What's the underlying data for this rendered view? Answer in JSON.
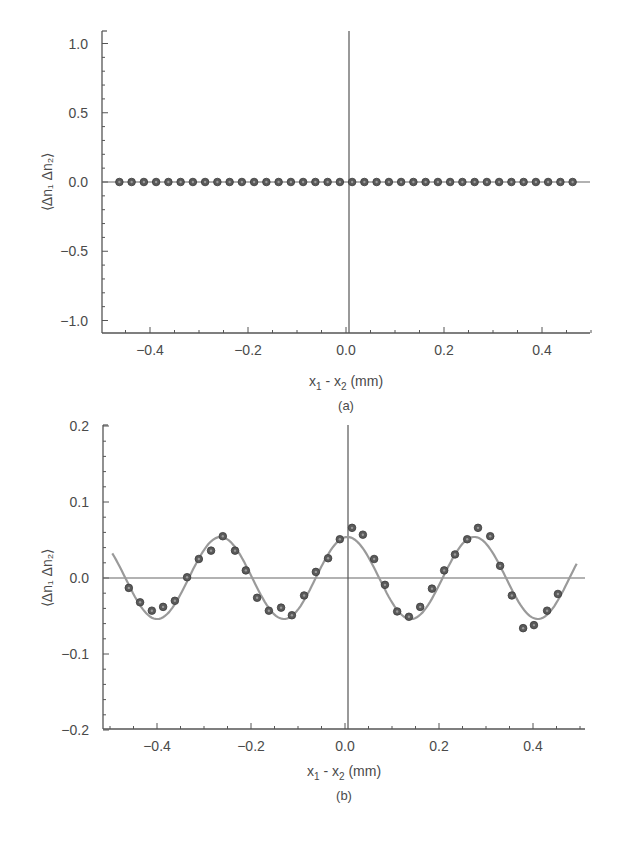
{
  "figure": {
    "panels": [
      {
        "id": "a",
        "caption": "(a)",
        "ylabel": "⟨Δn₁ Δn₂⟩",
        "xlabel_main": "x",
        "xlabel_sub1": "1",
        "xlabel_mid": " - x",
        "xlabel_sub2": "2",
        "xlabel_unit": " (mm)"
      },
      {
        "id": "b",
        "caption": "(b)",
        "ylabel": "⟨Δn₁ Δn₂⟩",
        "xlabel_main": "x",
        "xlabel_sub1": "1",
        "xlabel_mid": " - x",
        "xlabel_sub2": "2",
        "xlabel_unit": " (mm)"
      }
    ]
  },
  "colors": {
    "axis": "#555555",
    "marker_fill": "#5a5a5a",
    "marker_edge": "#3a3a3a",
    "fit_curve": "#9a9a9a",
    "text": "#4a4a4a"
  },
  "chart_data": [
    {
      "type": "scatter",
      "panel": "(a)",
      "title": "",
      "xlabel": "x1 - x2 (mm)",
      "ylabel": "<Δn1 Δn2>",
      "xlim": [
        -0.5,
        0.5
      ],
      "ylim": [
        -1.1,
        1.1
      ],
      "xticks": [
        -0.4,
        -0.2,
        0.0,
        0.2,
        0.4
      ],
      "xtick_labels": [
        "−0.4",
        "−0.2",
        "0.0",
        "0.2",
        "0.4"
      ],
      "yticks": [
        -1.0,
        -0.5,
        0.0,
        0.5,
        1.0
      ],
      "ytick_labels": [
        "−1.0",
        "−0.5",
        "0.0",
        "0.5",
        "1.0"
      ],
      "reference_lines": {
        "horizontal_y": 0.0,
        "vertical_x": 0.0
      },
      "grid": false,
      "series": [
        {
          "name": "measured",
          "style": "markers",
          "x": [
            -0.4625,
            -0.4375,
            -0.4125,
            -0.3875,
            -0.3625,
            -0.3375,
            -0.3125,
            -0.2875,
            -0.2625,
            -0.2375,
            -0.2125,
            -0.1875,
            -0.1625,
            -0.1375,
            -0.1125,
            -0.0875,
            -0.0625,
            -0.0375,
            -0.0125,
            0.0125,
            0.0375,
            0.0625,
            0.0875,
            0.1125,
            0.1375,
            0.1625,
            0.1875,
            0.2125,
            0.2375,
            0.2625,
            0.2875,
            0.3125,
            0.3375,
            0.3625,
            0.3875,
            0.4125,
            0.4375,
            0.4625
          ],
          "y": [
            0.0,
            0.0,
            0.0,
            0.0,
            0.0,
            0.0,
            0.0,
            0.0,
            0.0,
            0.0,
            0.0,
            0.0,
            0.0,
            0.0,
            0.0,
            0.0,
            0.0,
            0.0,
            0.0,
            0.0,
            0.0,
            0.0,
            0.0,
            0.0,
            0.0,
            0.0,
            0.0,
            0.0,
            0.0,
            0.0,
            0.0,
            0.0,
            0.0,
            0.0,
            0.0,
            0.0,
            0.0,
            0.0
          ]
        }
      ]
    },
    {
      "type": "scatter",
      "panel": "(b)",
      "title": "",
      "xlabel": "x1 - x2 (mm)",
      "ylabel": "<Δn1 Δn2>",
      "xlim": [
        -0.52,
        0.51
      ],
      "ylim": [
        -0.2,
        0.2
      ],
      "xticks": [
        -0.4,
        -0.2,
        0.0,
        0.2,
        0.4
      ],
      "xtick_labels": [
        "−0.4",
        "−0.2",
        "0.0",
        "0.2",
        "0.4"
      ],
      "yticks": [
        -0.2,
        -0.1,
        0.0,
        0.1,
        0.2
      ],
      "ytick_labels": [
        "−0.2",
        "−0.1",
        "0.0",
        "0.1",
        "0.2"
      ],
      "reference_lines": {
        "horizontal_y": 0.0,
        "vertical_x": 0.0
      },
      "grid": false,
      "series": [
        {
          "name": "measured",
          "style": "markers",
          "x": [
            -0.46,
            -0.436,
            -0.411,
            -0.387,
            -0.362,
            -0.336,
            -0.311,
            -0.285,
            -0.26,
            -0.234,
            -0.211,
            -0.187,
            -0.162,
            -0.136,
            -0.113,
            -0.087,
            -0.062,
            -0.036,
            -0.011,
            0.015,
            0.038,
            0.062,
            0.085,
            0.111,
            0.136,
            0.16,
            0.185,
            0.211,
            0.234,
            0.26,
            0.283,
            0.309,
            0.33,
            0.355,
            0.379,
            0.402,
            0.43,
            0.453
          ],
          "y": [
            -0.013,
            -0.032,
            -0.043,
            -0.038,
            -0.03,
            0.001,
            0.025,
            0.036,
            0.055,
            0.036,
            0.01,
            -0.026,
            -0.043,
            -0.039,
            -0.049,
            -0.023,
            0.008,
            0.026,
            0.051,
            0.066,
            0.057,
            0.025,
            -0.009,
            -0.044,
            -0.051,
            -0.038,
            -0.014,
            0.01,
            0.031,
            0.051,
            0.066,
            0.055,
            0.016,
            -0.023,
            -0.066,
            -0.062,
            -0.043,
            -0.021
          ]
        },
        {
          "name": "fit",
          "style": "line",
          "function": "A*cos(2*pi*x/period + phase)",
          "amplitude": 0.054,
          "period_mm": 0.27,
          "phase_rad": -0.12,
          "x_range": [
            -0.495,
            0.495
          ]
        }
      ]
    }
  ]
}
